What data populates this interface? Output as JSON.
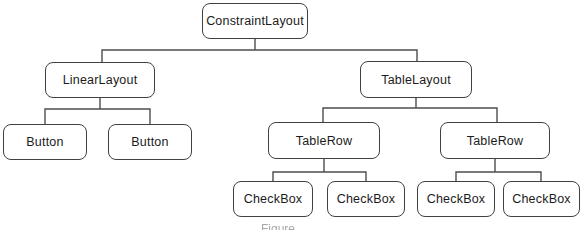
{
  "diagram": {
    "type": "tree",
    "nodes": [
      {
        "id": "constraintlayout",
        "label": "ConstraintLayout",
        "parent": null
      },
      {
        "id": "linearlayout",
        "label": "LinearLayout",
        "parent": "constraintlayout"
      },
      {
        "id": "tablelayout",
        "label": "TableLayout",
        "parent": "constraintlayout"
      },
      {
        "id": "button-1",
        "label": "Button",
        "parent": "linearlayout"
      },
      {
        "id": "button-2",
        "label": "Button",
        "parent": "linearlayout"
      },
      {
        "id": "tablerow-1",
        "label": "TableRow",
        "parent": "tablelayout"
      },
      {
        "id": "tablerow-2",
        "label": "TableRow",
        "parent": "tablelayout"
      },
      {
        "id": "checkbox-1",
        "label": "CheckBox",
        "parent": "tablerow-1"
      },
      {
        "id": "checkbox-2",
        "label": "CheckBox",
        "parent": "tablerow-1"
      },
      {
        "id": "checkbox-3",
        "label": "CheckBox",
        "parent": "tablerow-2"
      },
      {
        "id": "checkbox-4",
        "label": "CheckBox",
        "parent": "tablerow-2"
      }
    ]
  },
  "caption": {
    "text": "Figure"
  },
  "colors": {
    "background": "#ffffff",
    "box_border": "#414141",
    "box_fill": "#ffffff",
    "connector_line": "#4d4d4d",
    "label_text": "#1b1b1b",
    "caption_text": "#a8a8a8"
  }
}
